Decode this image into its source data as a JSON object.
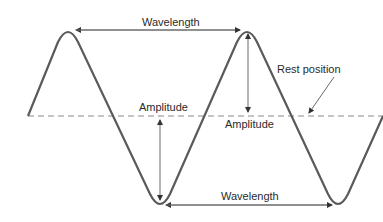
{
  "diagram": {
    "labels": {
      "wavelength_top": "Wavelength",
      "wavelength_bottom": "Wavelength",
      "amplitude_left": "Amplitude",
      "amplitude_right": "Amplitude",
      "rest_position": "Rest position"
    },
    "colors": {
      "wave": "#5a5a5a",
      "arrows": "#6a6a6a",
      "rest_line": "#8a8a8a",
      "text": "#2a2a2a"
    }
  }
}
